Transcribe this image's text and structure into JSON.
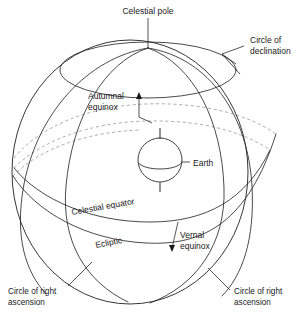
{
  "diagram": {
    "background_color": "#ffffff",
    "line_color": "#2b2b2b",
    "hidden_line_color": "#9a9a9a",
    "text_color": "#1a1a1a"
  },
  "labels": {
    "celestial_pole": "Celestial pole",
    "circle_of_declination_l1": "Circle of",
    "circle_of_declination_l2": "declination",
    "autumnal_equinox_l1": "Autumnal",
    "autumnal_equinox_l2": "equinox",
    "earth": "Earth",
    "celestial_equator": "Celestial equator",
    "ecliptic": "Ecliptic",
    "vernal_equinox_l1": "Vernal",
    "vernal_equinox_l2": "equinox",
    "circle_of_right_ascension_left_l1": "Circle of right",
    "circle_of_right_ascension_left_l2": "ascension",
    "circle_of_right_ascension_right_l1": "Circle of right",
    "circle_of_right_ascension_right_l2": "ascension"
  },
  "geometry": {
    "sphere_center_x": 130,
    "sphere_center_y": 172,
    "sphere_radius_x": 118,
    "sphere_radius_y": 132,
    "north_pole_x": 148,
    "north_pole_y": 48,
    "earth_center_x": 160,
    "earth_center_y": 160,
    "earth_radius": 22
  },
  "elements": [
    {
      "name": "celestial-sphere-outline",
      "kind": "ellipse"
    },
    {
      "name": "circle-of-declination",
      "kind": "small-ellipse"
    },
    {
      "name": "celestial-equator",
      "kind": "great-circle"
    },
    {
      "name": "ecliptic",
      "kind": "great-circle-tilted"
    },
    {
      "name": "circle-of-right-ascension-left",
      "kind": "meridian"
    },
    {
      "name": "circle-of-right-ascension-right",
      "kind": "meridian"
    },
    {
      "name": "earth",
      "kind": "sphere"
    },
    {
      "name": "polar-axis",
      "kind": "line"
    }
  ]
}
